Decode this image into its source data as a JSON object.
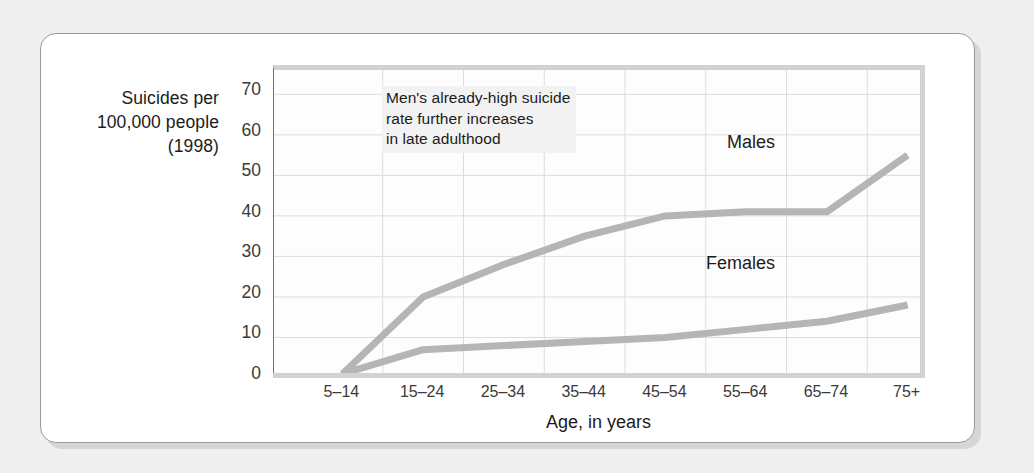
{
  "chart_data": {
    "type": "line",
    "title": "",
    "annotation": "Men's already-high suicide\nrate further increases\nin late adulthood",
    "ylabel": "Suicides per\n100,000 people\n(1998)",
    "xlabel": "Age, in years",
    "categories": [
      "5–14",
      "15–24",
      "25–34",
      "35–44",
      "45–54",
      "55–64",
      "65–74",
      "75+"
    ],
    "yticks": [
      0,
      10,
      20,
      30,
      40,
      50,
      60,
      70
    ],
    "ylim": [
      0,
      76
    ],
    "grid": true,
    "legend_position": "inline-labels",
    "series": [
      {
        "name": "Males",
        "values": [
          1,
          20,
          28,
          35,
          40,
          41,
          41,
          55
        ]
      },
      {
        "name": "Females",
        "values": [
          1,
          7,
          8,
          9,
          10,
          12,
          14,
          18
        ]
      }
    ]
  },
  "labels": {
    "males": "Males",
    "females": "Females"
  }
}
